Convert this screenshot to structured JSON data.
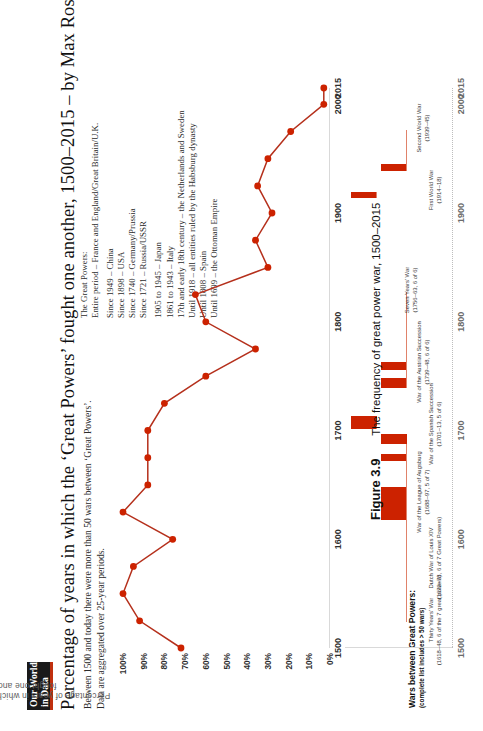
{
  "logo": {
    "line1": "Our World",
    "line2": "in Data"
  },
  "header": {
    "title": "Percentage of years in which the ‘Great Powers’ fought one another, 1500–2015 – by Max Roser",
    "subtitle_1": "Between 1500 and today there were more than 50 wars between ‘Great Powers’.",
    "subtitle_2": "Data are aggregated over 25-year periods."
  },
  "legend": {
    "heading": "The Great Powers:",
    "rows": [
      "Entire period – France and England/Great Britain/U.K.",
      "Since 1949 – China",
      "Since 1898 – USA",
      "Since 1740 – Germany/Prussia",
      "Since 1721 – Russia/USSR",
      "1905 to 1945  – Japan",
      "1861 to 1943 – Italy",
      "17th and early 18th century – the Netherlands and Sweden",
      "Until 1918 – all entities ruled by the Habsburg dynasty",
      "Until 1808 – Spain",
      "Until 1699 – the Ottoman Empire"
    ]
  },
  "axes": {
    "ylabel": "Percentage of years in which the great powers fought one another",
    "yticks": [
      "100%",
      "90%",
      "80%",
      "70%",
      "60%",
      "50%",
      "40%",
      "30%",
      "20%",
      "10%",
      "0%"
    ],
    "xticks": [
      "1500",
      "1600",
      "1700",
      "1800",
      "1900",
      "2000",
      "2015"
    ],
    "xticks_lower": [
      "1500",
      "1600",
      "1700",
      "1800",
      "1900",
      "2000",
      "2015"
    ]
  },
  "wars_panel": {
    "title": "Wars between Great Powers:",
    "subtitle": "(complete list includes > 50 wars)",
    "items": [
      {
        "name": "Thirty Years’ War",
        "detail": "(1618–48, 6 of the 7 great powers)"
      },
      {
        "name": "Dutch War of Louis XIV",
        "detail": "(1672–78, 6 of 7 Great Powers)"
      },
      {
        "name": "War of the League of Augsburg",
        "detail": "(1688–97, 5 of 7)"
      },
      {
        "name": "War of the Spanish Succession",
        "detail": "(1701–13, 5 of 6)"
      },
      {
        "name": "War of the Austrian Succession",
        "detail": "(1739–48, 6 of 6)"
      },
      {
        "name": "Seven Years’ War",
        "detail": "(1756–63, 6 of 6)"
      },
      {
        "name": "First World War",
        "detail": "(1914–18)"
      },
      {
        "name": "Second World War",
        "detail": "(1939–45)"
      }
    ]
  },
  "caption": {
    "number": "Figure 3.9",
    "text": "The frequency of great power war, 1500–2015"
  },
  "colors": {
    "accent": "#cc2200",
    "line": "#b5301c",
    "marker": "#cc2200",
    "callout": "#e0826a",
    "axis": "#d9d9d9",
    "text": "#2b2b2b"
  },
  "chart_data": {
    "type": "line",
    "title": "Percentage of years in which the ‘Great Powers’ fought one another, 1500–2015",
    "xlabel": "",
    "ylabel": "Percentage of years in which the great powers fought one another",
    "xlim": [
      1500,
      2015
    ],
    "ylim": [
      0,
      100
    ],
    "ytick_values": [
      100,
      90,
      80,
      70,
      80,
      60,
      50,
      40,
      30,
      20,
      10,
      0
    ],
    "grid": false,
    "legend_position": "top-right (text block)",
    "x": [
      1500,
      1525,
      1550,
      1575,
      1600,
      1625,
      1650,
      1675,
      1700,
      1725,
      1750,
      1775,
      1800,
      1825,
      1850,
      1875,
      1900,
      1925,
      1950,
      1975,
      2000,
      2015
    ],
    "values": [
      72,
      92,
      100,
      95,
      76,
      100,
      88,
      88,
      88,
      80,
      60,
      36,
      60,
      65,
      30,
      36,
      28,
      35,
      30,
      19,
      3,
      3
    ],
    "series": [
      {
        "name": "Percentage of years with war between Great Powers",
        "values": [
          72,
          92,
          100,
          95,
          76,
          100,
          88,
          88,
          88,
          80,
          60,
          36,
          60,
          65,
          30,
          36,
          28,
          35,
          30,
          19,
          3,
          3
        ]
      }
    ],
    "wars_bars": [
      {
        "label": "Thirty Years’ War",
        "start": 1618,
        "end": 1648,
        "powers": "6 of the 7 great powers",
        "row": 0
      },
      {
        "label": "Dutch War of Louis XIV",
        "start": 1672,
        "end": 1678,
        "powers": "6 of 7 Great Powers",
        "row": 0
      },
      {
        "label": "War of the League of Augsburg",
        "start": 1688,
        "end": 1697,
        "powers": "5 of 7",
        "row": 0
      },
      {
        "label": "War of the Spanish Succession",
        "start": 1701,
        "end": 1713,
        "powers": "5 of 6",
        "row": 1
      },
      {
        "label": "War of the Austrian Succession",
        "start": 1739,
        "end": 1748,
        "powers": "6 of 6",
        "row": 0
      },
      {
        "label": "Seven Years’ War",
        "start": 1756,
        "end": 1763,
        "powers": "6 of 6",
        "row": 0
      },
      {
        "label": "First World War",
        "start": 1914,
        "end": 1918,
        "powers": "",
        "row": 1
      },
      {
        "label": "Second World War",
        "start": 1939,
        "end": 1945,
        "powers": "",
        "row": 0
      }
    ]
  }
}
